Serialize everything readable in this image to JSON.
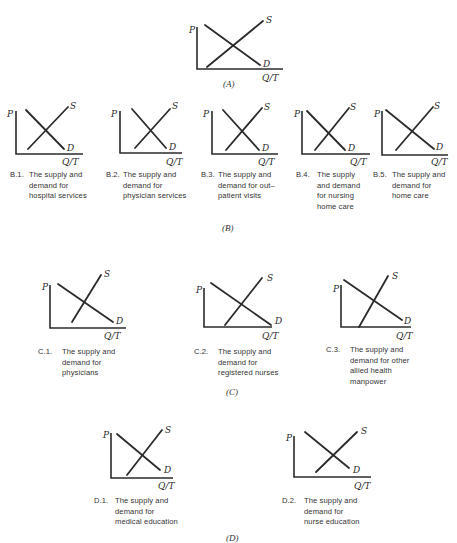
{
  "panels": {
    "A": "(A)",
    "B": "(B)",
    "C": "(C)",
    "D": "(D)"
  },
  "axis_labels": {
    "price": "P",
    "quantity": "Q/T",
    "supply": "S",
    "demand": "D"
  },
  "captions": {
    "B1": {
      "num": "B.1.",
      "text": "The supply and\ndemand for\nhospital services"
    },
    "B2": {
      "num": "B.2.",
      "text": "The supply and\ndemand for\nphysician services"
    },
    "B3": {
      "num": "B.3.",
      "text": "The supply and\ndemand for out–\npatient visits"
    },
    "B4": {
      "num": "B.4.",
      "text": "The supply\nand demand\nfor nursing\nhome care"
    },
    "B5": {
      "num": "B.5.",
      "text": "The supply and\ndemand for\nhome care"
    },
    "C1": {
      "num": "C.1.",
      "text": "The supply and\ndemand for\nphysicians"
    },
    "C2": {
      "num": "C.2.",
      "text": "The supply and\ndemand for\nregistered nurses"
    },
    "C3": {
      "num": "C.3.",
      "text": "The supply and\ndemand for other\nallied health\nmanpower"
    },
    "D1": {
      "num": "D.1.",
      "text": "The supply and\ndemand for\nmedical education"
    },
    "D2": {
      "num": "D.2.",
      "text": "The supply and\ndemand for\nnurse education"
    }
  },
  "colors": {
    "ink": "#2b2b2b",
    "paper": "#ffffff"
  }
}
